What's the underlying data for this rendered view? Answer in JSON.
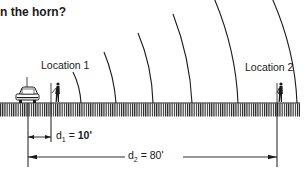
{
  "question": {
    "title_fragment": "n the horn?"
  },
  "labels": {
    "location_1": "Location 1",
    "location_2": "Location 2"
  },
  "dimensions": {
    "d1": {
      "var": "d",
      "sub": "1",
      "eq": " = ",
      "value": "10'"
    },
    "d2": {
      "var": "d",
      "sub": "2",
      "eq": " = ",
      "value": "80'"
    }
  },
  "colors": {
    "ink": "#1a1a1a",
    "background": "#ffffff"
  },
  "figure": {
    "sound_wave_count": 6,
    "source": "car-horn",
    "listeners": 2
  }
}
